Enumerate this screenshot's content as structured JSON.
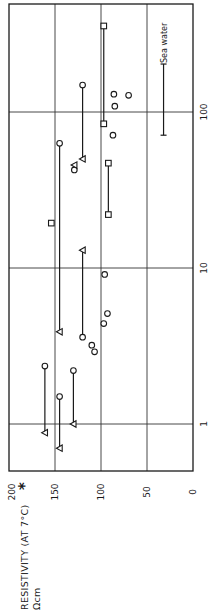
{
  "chart_data": {
    "type": "scatter",
    "orientation": "rotated-90-ccw",
    "title": "",
    "ylabel": "RESISTIVITY (AT 7°C) *",
    "ylabel_unit": "Ωcm",
    "xlabel": "",
    "x_scale": "log",
    "xlim": [
      0.5,
      490
    ],
    "ylim": [
      0,
      200
    ],
    "x_ticks": [
      1,
      10,
      100
    ],
    "x_tick_labels": [
      "1",
      "10",
      "100"
    ],
    "y_ticks": [
      0,
      50,
      100,
      150,
      200
    ],
    "y_tick_labels": [
      "0",
      "50",
      "100",
      "150",
      "200"
    ],
    "grid": true,
    "annotations": [
      {
        "text": "Sea water",
        "type": "range-bar",
        "resistivity": 32,
        "x_from": 71,
        "x_to": 203
      }
    ],
    "series": [
      {
        "name": "circles",
        "marker": "circle",
        "points": [
          {
            "x": 149,
            "y": 120
          },
          {
            "x": 130,
            "y": 86
          },
          {
            "x": 128,
            "y": 70
          },
          {
            "x": 109,
            "y": 85
          },
          {
            "x": 71,
            "y": 87
          },
          {
            "x": 63,
            "y": 145
          },
          {
            "x": 42.5,
            "y": 129
          },
          {
            "x": 9.1,
            "y": 96
          },
          {
            "x": 5.1,
            "y": 93
          },
          {
            "x": 4.4,
            "y": 97
          },
          {
            "x": 3.6,
            "y": 120
          },
          {
            "x": 3.2,
            "y": 110
          },
          {
            "x": 2.9,
            "y": 107
          },
          {
            "x": 2.35,
            "y": 161
          },
          {
            "x": 2.2,
            "y": 130
          },
          {
            "x": 1.5,
            "y": 145
          }
        ]
      },
      {
        "name": "triangles",
        "marker": "triangle",
        "points": [
          {
            "x": 50,
            "y": 120
          },
          {
            "x": 45.7,
            "y": 129
          },
          {
            "x": 13,
            "y": 120
          },
          {
            "x": 3.9,
            "y": 145
          },
          {
            "x": 1.0,
            "y": 130
          },
          {
            "x": 0.88,
            "y": 161
          },
          {
            "x": 0.7,
            "y": 145
          }
        ]
      },
      {
        "name": "squares",
        "marker": "square",
        "points": [
          {
            "x": 356,
            "y": 97
          },
          {
            "x": 84,
            "y": 97
          },
          {
            "x": 47,
            "y": 92
          },
          {
            "x": 22,
            "y": 92
          },
          {
            "x": 19.4,
            "y": 154
          }
        ]
      }
    ],
    "connectors": [
      {
        "resistivity": 97,
        "x_from": 84,
        "x_to": 356
      },
      {
        "resistivity": 120,
        "x_from": 50,
        "x_to": 149
      },
      {
        "resistivity": 92,
        "x_from": 22,
        "x_to": 47
      },
      {
        "resistivity": 145,
        "x_from": 3.9,
        "x_to": 63
      },
      {
        "resistivity": 120,
        "x_from": 3.6,
        "x_to": 13
      },
      {
        "resistivity": 161,
        "x_from": 0.88,
        "x_to": 2.35
      },
      {
        "resistivity": 130,
        "x_from": 1.0,
        "x_to": 2.2
      },
      {
        "resistivity": 145,
        "x_from": 0.7,
        "x_to": 1.5
      }
    ]
  },
  "labels": {
    "axis_title": "RESISTIVITY (AT 7°C)",
    "asterisk": "*",
    "unit": "Ωcm",
    "sea_water": "Sea water"
  }
}
